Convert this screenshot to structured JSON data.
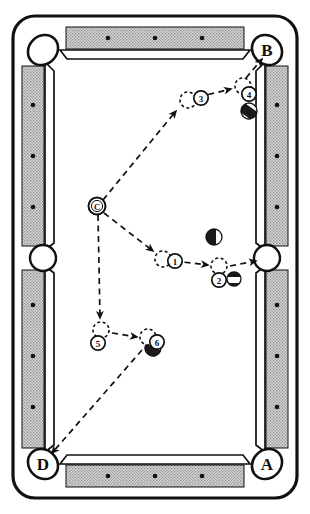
{
  "diagram": {
    "type": "billiards-table-layout",
    "table": {
      "orientation": "portrait",
      "felt_color": "#ffffff",
      "rail_color": "#c9c9c9",
      "outline_color": "#000000",
      "rail_dots_top": 3,
      "rail_dots_bottom": 3,
      "rail_dots_left": 3,
      "rail_dots_right": 3
    },
    "pockets": [
      {
        "id": "p-top-left",
        "label": "",
        "position": "top-left",
        "labeled": false
      },
      {
        "id": "p-top-right",
        "label": "B",
        "position": "top-right",
        "labeled": true
      },
      {
        "id": "p-side-left",
        "label": "",
        "position": "side-left",
        "labeled": false
      },
      {
        "id": "p-side-right",
        "label": "",
        "position": "side-right",
        "labeled": false
      },
      {
        "id": "p-bottom-left",
        "label": "D",
        "position": "bottom-left",
        "labeled": true
      },
      {
        "id": "p-bottom-right",
        "label": "A",
        "position": "bottom-right",
        "labeled": true
      }
    ],
    "cue_ball": {
      "label": "C",
      "x": 97,
      "y": 206
    },
    "ghost_positions": [
      {
        "label": "1",
        "x": 163,
        "y": 259,
        "badge_dx": 12,
        "badge_dy": 2
      },
      {
        "label": "2",
        "x": 219,
        "y": 266,
        "badge_dx": 0,
        "badge_dy": 14
      },
      {
        "label": "3",
        "x": 188,
        "y": 100,
        "badge_dx": 13,
        "badge_dy": -2
      },
      {
        "label": "4",
        "x": 243,
        "y": 86,
        "badge_dx": 6,
        "badge_dy": 12
      },
      {
        "label": "5",
        "x": 101,
        "y": 330,
        "badge_dx": -3,
        "badge_dy": 13
      },
      {
        "label": "6",
        "x": 148,
        "y": 337,
        "badge_dx": 9,
        "badge_dy": 5
      }
    ],
    "object_balls": [
      {
        "id": "ball-near-4",
        "style": "striped-dark",
        "x": 249,
        "y": 111,
        "r": 8
      },
      {
        "id": "ball-center",
        "style": "striped-dark",
        "x": 214,
        "y": 237,
        "r": 8
      },
      {
        "id": "ball-near-2",
        "style": "striped-dark",
        "x": 234,
        "y": 279,
        "r": 7
      },
      {
        "id": "ball-near-6",
        "style": "striped-dark",
        "x": 153,
        "y": 348,
        "r": 8
      }
    ],
    "paths": [
      {
        "id": "path-c-to-3",
        "from": "C",
        "to": "3",
        "arrow": true
      },
      {
        "id": "path-3-to-4",
        "from": "3",
        "to": "4",
        "arrow": true
      },
      {
        "id": "path-4-to-B",
        "from": "4",
        "to": "B",
        "arrow": true
      },
      {
        "id": "path-c-to-1",
        "from": "C",
        "to": "1",
        "arrow": true
      },
      {
        "id": "path-1-to-2",
        "from": "1",
        "to": "2",
        "arrow": true
      },
      {
        "id": "path-2-to-side",
        "from": "2",
        "to": "side-right-pocket",
        "arrow": true
      },
      {
        "id": "path-c-to-5",
        "from": "C",
        "to": "5",
        "arrow": true
      },
      {
        "id": "path-5-to-6",
        "from": "5",
        "to": "6",
        "arrow": true
      },
      {
        "id": "path-6-to-D",
        "from": "6",
        "to": "D",
        "arrow": true
      }
    ],
    "line_style": "dashed"
  }
}
